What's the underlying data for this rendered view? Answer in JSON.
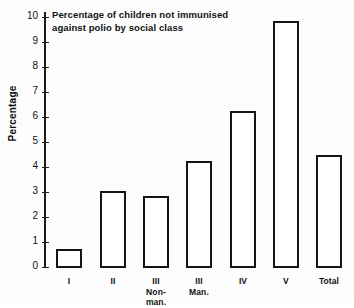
{
  "chart_data": {
    "type": "bar",
    "title": "Percentage of children not immunised against polio by social class",
    "title_lines": [
      "Percentage of children not immunised",
      "against polio by social class"
    ],
    "xlabel": "",
    "ylabel": "Percentage",
    "categories": [
      "I",
      "II",
      "III Non-man.",
      "III Man.",
      "IV",
      "V",
      "Total"
    ],
    "category_lines": [
      [
        "I"
      ],
      [
        "II"
      ],
      [
        "III",
        "Non-",
        "man."
      ],
      [
        "III",
        "Man."
      ],
      [
        "IV"
      ],
      [
        "V"
      ],
      [
        "Total"
      ]
    ],
    "values": [
      0.76,
      3.08,
      2.87,
      4.3,
      6.28,
      9.9,
      4.52
    ],
    "ylim": [
      0,
      10
    ],
    "ytick_labels": [
      "0",
      "1",
      "2",
      "3",
      "4",
      "5",
      "6",
      "7",
      "8",
      "9",
      "10"
    ],
    "ytick_values": [
      0,
      1,
      2,
      3,
      4,
      5,
      6,
      7,
      8,
      9,
      10
    ],
    "grid": false,
    "legend": null,
    "bar_fill_color": "#ffffff",
    "bar_edge_color": "#151515",
    "background_color": "#fdfdfd",
    "text_color": "#111111"
  }
}
